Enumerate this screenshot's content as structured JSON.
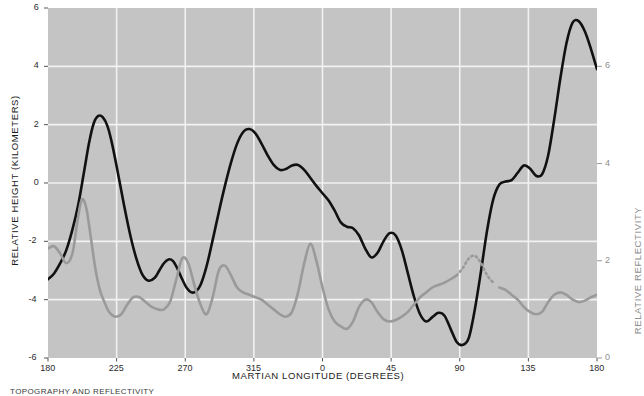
{
  "chart_data": {
    "type": "line",
    "title": "",
    "xlabel": "MARTIAN LONGITUDE (DEGREES)",
    "ylabel": "RELATIVE HEIGHT (KILOMETERS)",
    "ylabel_right": "RELATIVE REFLECTIVITY",
    "grid": true,
    "legend_position": "none",
    "plot_background": "#c4c4c4",
    "xlim": [
      180,
      540
    ],
    "ylim": [
      -6,
      6
    ],
    "ylim_right": [
      0,
      7.2
    ],
    "xticks": [
      180,
      225,
      270,
      315,
      360,
      405,
      450,
      495,
      540
    ],
    "xtick_labels": [
      "180",
      "225",
      "270",
      "315",
      "0",
      "45",
      "90",
      "135",
      "180"
    ],
    "yticks": [
      -6,
      -4,
      -2,
      0,
      2,
      4,
      6
    ],
    "ytick_labels": [
      "-6",
      "-4",
      "-2",
      "0",
      "2",
      "4",
      "6"
    ],
    "yticks_right": [
      0,
      2,
      4,
      6
    ],
    "ytick_labels_right": [
      "0",
      "2",
      "4",
      "6"
    ],
    "series": [
      {
        "name": "Relative height",
        "color": "#111111",
        "axis": "left",
        "linestyle": "solid",
        "width": 2.6,
        "x": [
          180,
          184,
          188,
          192,
          196,
          200,
          204,
          207,
          210,
          213,
          216,
          219,
          222,
          226,
          230,
          234,
          238,
          242,
          246,
          250,
          253,
          256,
          259,
          262,
          265,
          268,
          271,
          274,
          277,
          280,
          284,
          288,
          292,
          296,
          300,
          304,
          308,
          312,
          316,
          320,
          324,
          328,
          332,
          336,
          340,
          344,
          348,
          352,
          356,
          360,
          364,
          368,
          372,
          376,
          380,
          384,
          388,
          392,
          396,
          400,
          404,
          408,
          412,
          416,
          420,
          424,
          428,
          432,
          436,
          440,
          444,
          448,
          452,
          456,
          460,
          464,
          468,
          472,
          476,
          480,
          484,
          488,
          492,
          496,
          500,
          504,
          508,
          512,
          516,
          520,
          524,
          528,
          532,
          536,
          540
        ],
        "y": [
          -3.3,
          -3.1,
          -2.75,
          -2.3,
          -1.6,
          -0.7,
          0.5,
          1.4,
          2.05,
          2.3,
          2.25,
          1.95,
          1.35,
          0.3,
          -0.8,
          -1.8,
          -2.6,
          -3.15,
          -3.35,
          -3.25,
          -3.0,
          -2.75,
          -2.62,
          -2.68,
          -2.95,
          -3.3,
          -3.6,
          -3.75,
          -3.72,
          -3.5,
          -2.85,
          -1.95,
          -1.0,
          -0.1,
          0.7,
          1.35,
          1.75,
          1.85,
          1.7,
          1.35,
          0.95,
          0.62,
          0.45,
          0.48,
          0.6,
          0.62,
          0.45,
          0.18,
          -0.1,
          -0.35,
          -0.6,
          -0.95,
          -1.35,
          -1.5,
          -1.55,
          -1.8,
          -2.25,
          -2.55,
          -2.4,
          -2.0,
          -1.72,
          -1.8,
          -2.3,
          -3.1,
          -3.9,
          -4.5,
          -4.75,
          -4.6,
          -4.45,
          -4.55,
          -5.0,
          -5.45,
          -5.55,
          -5.3,
          -4.3,
          -3.0,
          -1.6,
          -0.55,
          -0.05,
          0.05,
          0.1,
          0.35,
          0.6,
          0.5,
          0.25,
          0.3,
          0.95,
          2.2,
          3.6,
          4.8,
          5.5,
          5.55,
          5.2,
          4.6,
          3.9
        ],
        "y_tail": [
          3.9,
          3.1,
          2.1,
          1.0,
          0.05,
          -0.8,
          -1.6,
          -2.4,
          -3.1,
          -3.7,
          -4.2,
          -4.45,
          -4.4,
          -4.05,
          -3.5,
          -3.05,
          -2.9,
          -2.9
        ],
        "x_tail": [
          540,
          544,
          548,
          552,
          556,
          560,
          564,
          568,
          572,
          576,
          580,
          584,
          588,
          592,
          596,
          600,
          604,
          608
        ]
      },
      {
        "name": "Relative reflectivity",
        "color": "#9a9a9a",
        "axis": "right",
        "linestyle": "solid-with-dotted-gap",
        "width": 2.6,
        "dotted_range": [
          448,
          474
        ],
        "x": [
          180,
          184,
          188,
          192,
          196,
          199,
          202,
          205,
          208,
          211,
          214,
          217,
          220,
          224,
          228,
          232,
          236,
          240,
          244,
          248,
          252,
          256,
          260,
          264,
          268,
          272,
          276,
          280,
          284,
          288,
          292,
          296,
          300,
          304,
          308,
          312,
          316,
          320,
          324,
          328,
          332,
          336,
          340,
          344,
          348,
          352,
          356,
          360,
          364,
          368,
          372,
          376,
          380,
          384,
          388,
          392,
          396,
          400,
          404,
          408,
          412,
          416,
          420,
          424,
          428,
          432,
          436,
          440,
          444,
          448,
          452,
          456,
          460,
          464,
          468,
          472,
          476,
          480,
          484,
          488,
          492,
          496,
          500,
          504,
          508,
          512,
          516,
          520,
          524,
          528,
          532,
          536,
          540
        ],
        "y": [
          2.25,
          2.3,
          2.15,
          1.95,
          2.15,
          2.75,
          3.25,
          3.1,
          2.5,
          1.85,
          1.4,
          1.15,
          0.95,
          0.85,
          0.9,
          1.1,
          1.25,
          1.25,
          1.15,
          1.05,
          1.0,
          1.0,
          1.15,
          1.6,
          2.05,
          1.95,
          1.5,
          1.1,
          0.9,
          1.25,
          1.8,
          1.9,
          1.7,
          1.45,
          1.35,
          1.3,
          1.25,
          1.2,
          1.1,
          1.0,
          0.9,
          0.85,
          0.95,
          1.35,
          1.95,
          2.35,
          2.0,
          1.45,
          1.0,
          0.75,
          0.65,
          0.6,
          0.75,
          1.05,
          1.2,
          1.15,
          0.95,
          0.8,
          0.75,
          0.78,
          0.85,
          0.95,
          1.1,
          1.25,
          1.35,
          1.45,
          1.5,
          1.55,
          1.62,
          1.7,
          1.85,
          2.05,
          2.1,
          1.95,
          1.7,
          1.55,
          1.45,
          1.4,
          1.3,
          1.2,
          1.05,
          0.95,
          0.9,
          0.95,
          1.15,
          1.3,
          1.35,
          1.3,
          1.2,
          1.15,
          1.18,
          1.25,
          1.3
        ],
        "x_tail": [
          540,
          544,
          548,
          552,
          556,
          560,
          564,
          568,
          572,
          576,
          580,
          584,
          588,
          592,
          596,
          600,
          604,
          608
        ],
        "y_tail": [
          1.3,
          1.2,
          1.0,
          0.85,
          0.8,
          0.85,
          0.95,
          1.05,
          1.2,
          1.35,
          1.55,
          1.85,
          2.3,
          2.2,
          1.95,
          1.85,
          2.0,
          2.35
        ]
      }
    ]
  },
  "caption": {
    "text": "TOPOGRAPHY AND REFLECTIVITY"
  }
}
